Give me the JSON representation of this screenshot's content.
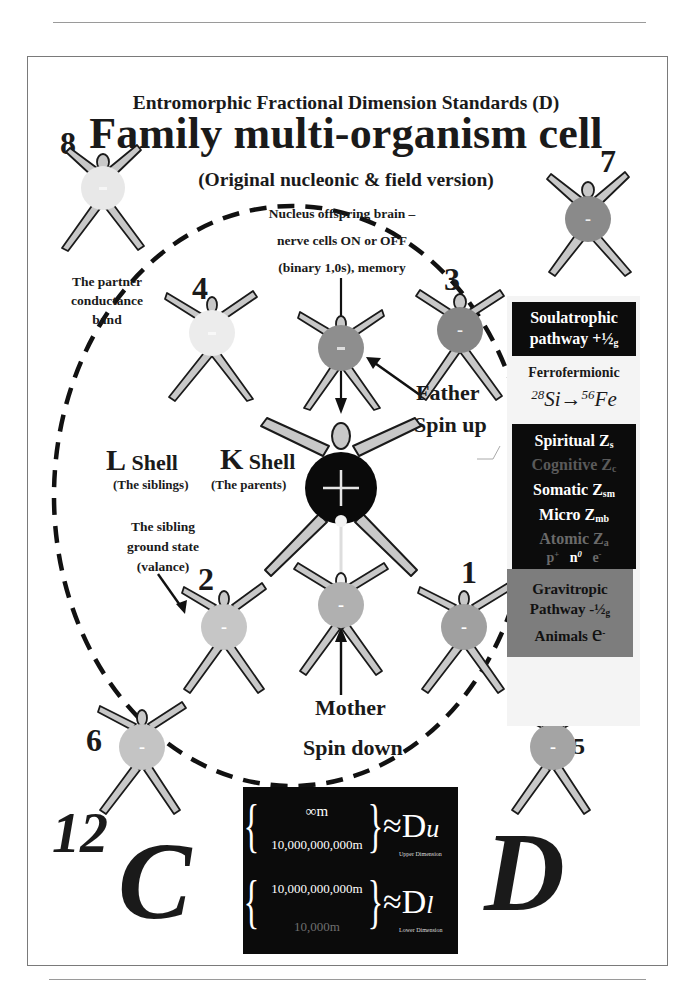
{
  "header": {
    "subtitle": "Entromorphic Fractional Dimension Standards (D)",
    "title": "Family multi-organism cell",
    "version": "(Original nucleonic & field version)"
  },
  "figures": [
    {
      "id": "8",
      "label": "8",
      "fill": "#e8e8e8",
      "sign": "-"
    },
    {
      "id": "7",
      "label": "7",
      "fill": "#8a8a8a",
      "sign": "-"
    },
    {
      "id": "4",
      "label": "4",
      "fill": "#ececec",
      "sign": "-"
    },
    {
      "id": "father",
      "label": "",
      "fill": "#8e8e8e",
      "sign": "-"
    },
    {
      "id": "3",
      "label": "3",
      "fill": "#858585",
      "sign": "-"
    },
    {
      "id": "nucleus",
      "label": "",
      "fill": "#0a0a0a",
      "sign": "+"
    },
    {
      "id": "2",
      "label": "2",
      "fill": "#c6c6c6",
      "sign": "-"
    },
    {
      "id": "mother",
      "label": "",
      "fill": "#b0b0b0",
      "sign": "-"
    },
    {
      "id": "1",
      "label": "1",
      "fill": "#a0a0a0",
      "sign": "-"
    },
    {
      "id": "6",
      "label": "6",
      "fill": "#c4c4c4",
      "sign": "-"
    },
    {
      "id": "5",
      "label": "5",
      "fill": "#a4a4a4",
      "sign": "-"
    }
  ],
  "labels": {
    "partner": [
      "The partner",
      "conductance",
      "band"
    ],
    "nucleus_note": [
      "Nucleus offspring brain –",
      "nerve cells ON or OFF",
      "(binary 1,0s), memory"
    ],
    "father": "Father",
    "spin_up": "Spin up",
    "mother": "Mother",
    "spin_down": "Spin down",
    "l_shell_letter": "L",
    "l_shell_word": "Shell",
    "l_shell_desc": "(The siblings)",
    "k_shell_letter": "K",
    "k_shell_word": "Shell",
    "k_shell_desc": "(The parents)",
    "sibling_ground": [
      "The sibling",
      "ground state",
      "(valance)"
    ]
  },
  "side_panel": {
    "soulatrophic": {
      "line1": "Soulatrophic",
      "line2": "pathway +½",
      "sub": "g"
    },
    "ferro": {
      "title": "Ferrofermionic",
      "left_mass": "28",
      "left_el": "Si",
      "arrow": "→",
      "right_mass": "56",
      "right_el": "Fe"
    },
    "levels": [
      {
        "name": "Spiritual Z",
        "sub": "s",
        "color": "#ffffff"
      },
      {
        "name": "Cognitive Z",
        "sub": "c",
        "color": "#5a5a5a"
      },
      {
        "name": "Somatic Z",
        "sub": "sm",
        "color": "#ffffff"
      },
      {
        "name": "Micro Z",
        "sub": "mb",
        "color": "#ffffff"
      },
      {
        "name": "Atomic  Z",
        "sub": "a",
        "color": "#6a6a6a"
      }
    ],
    "particles": {
      "p": "p",
      "p_sup": "+",
      "n": "n",
      "n_sup": "0",
      "e": "e",
      "e_sup": "-"
    },
    "gravitropic": {
      "line1": "Gravitropic",
      "line2": "Pathway -½",
      "sub": "g",
      "line3": "Animals",
      "e": "e",
      "e_sup": "-"
    }
  },
  "formula": {
    "upper_top": "∞m",
    "upper_bottom": "10,000,000,000m",
    "upper_symbol": "≈D",
    "upper_sub": "u",
    "upper_caption": "Upper Dimension",
    "lower_top": "10,000,000,000m",
    "lower_bottom": "10,000m",
    "lower_symbol": "≈D",
    "lower_sub": "l",
    "lower_caption": "Lower Dimension"
  },
  "corner": {
    "carbon_mass": "12",
    "carbon_symbol": "C",
    "dimension_symbol": "D"
  },
  "colors": {
    "panel_dark": "#0c0c0c",
    "panel_gray": "#7d7d7d",
    "body_fill": "#c8c8c8",
    "outline": "#1a1a1a"
  }
}
